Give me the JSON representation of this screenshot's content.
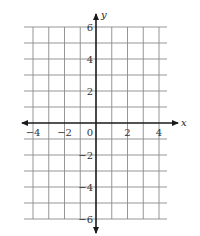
{
  "figure": {
    "type": "coordinate-plane",
    "x_axis": {
      "label": "x",
      "range": [
        -4.5,
        4.5
      ],
      "grid_step": 1,
      "tick_labels": [
        {
          "value": -4,
          "text": "−4"
        },
        {
          "value": -2,
          "text": "−2"
        },
        {
          "value": 0,
          "text": "0"
        },
        {
          "value": 2,
          "text": "2"
        },
        {
          "value": 4,
          "text": "4"
        }
      ]
    },
    "y_axis": {
      "label": "y",
      "range": [
        -6,
        6
      ],
      "grid_step": 1,
      "tick_labels": [
        {
          "value": 6,
          "text": "6"
        },
        {
          "value": 4,
          "text": "4"
        },
        {
          "value": 2,
          "text": "2"
        },
        {
          "value": -2,
          "text": "−2"
        },
        {
          "value": -4,
          "text": "−4"
        },
        {
          "value": -6,
          "text": "−6"
        }
      ]
    },
    "colors": {
      "grid": "#8a8a8a",
      "axis": "#1a1a1a",
      "text": "#333333"
    }
  }
}
